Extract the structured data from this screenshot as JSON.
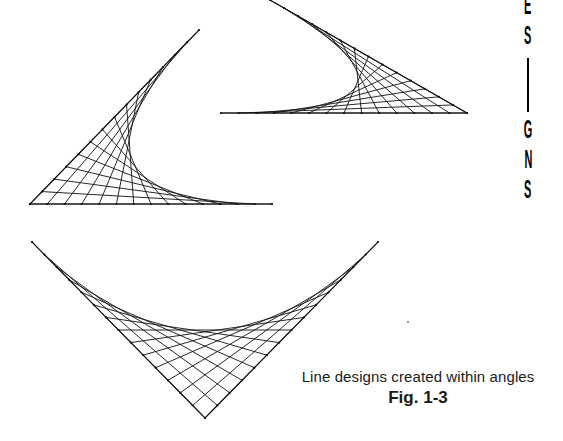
{
  "page": {
    "caption": {
      "text": "Line designs created within angles",
      "figure_label": "Fig. 1-3"
    },
    "side_margin_text": {
      "letters": [
        "E",
        "S",
        "G",
        "N",
        "S"
      ],
      "has_dash_after_index": 1
    },
    "figure": {
      "description": "Three string-art line designs, each formed by connecting equally spaced points along the two arms of an angle, producing a parabolic envelope curve.",
      "stroke_color": "#111111",
      "designs": [
        {
          "id": "left-angle-design",
          "arm_tip_a": [
            199,
            30
          ],
          "vertex": [
            30,
            204
          ],
          "arm_tip_b": [
            272,
            204
          ],
          "divisions": 14
        },
        {
          "id": "top-right-angle-design",
          "arm_tip_a": [
            270,
            0
          ],
          "vertex": [
            467,
            113
          ],
          "arm_tip_b": [
            221,
            113
          ],
          "divisions": 14
        },
        {
          "id": "bottom-angle-design",
          "arm_tip_a": [
            32,
            242
          ],
          "vertex": [
            205,
            418
          ],
          "arm_tip_b": [
            378,
            242
          ],
          "divisions": 14
        }
      ]
    }
  }
}
